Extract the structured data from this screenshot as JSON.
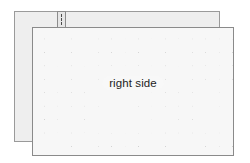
{
  "diagram": {
    "back_panel": {
      "label": "wrong side",
      "fill_color": "#eeeeee",
      "border_color": "#9a9a9a"
    },
    "front_panel": {
      "label": "right side",
      "fill_color": "#f7f7f7",
      "border_color": "#8a8a8a",
      "pattern": "diagonal-crosshatch-dashed",
      "pattern_color": "#4d4d4d",
      "pattern_cell_size": "19px"
    },
    "notch": {
      "name": "notch-tab",
      "fill_color": "#e6e6e6",
      "border_color": "#8c8c8c",
      "dash_color": "#4a4a4a"
    },
    "background_color": "#ffffff"
  }
}
